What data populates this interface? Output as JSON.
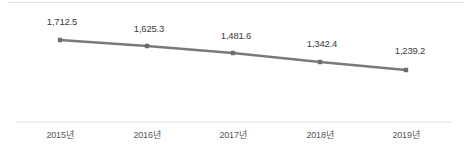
{
  "chart_data": {
    "type": "line",
    "title": "",
    "subtitle": "",
    "xlabel": "",
    "ylabel": "",
    "categories": [
      "2015년",
      "2016년",
      "2017년",
      "2018년",
      "2019년"
    ],
    "values": [
      1712.5,
      1625.3,
      1481.6,
      1342.4,
      1239.2
    ],
    "value_labels": [
      "1,712.5",
      "1,625.3",
      "1,481.6",
      "1,342.4",
      "1,239.2"
    ],
    "series": [
      {
        "name": "",
        "values": [
          1712.5,
          1625.3,
          1481.6,
          1342.4,
          1239.2
        ]
      }
    ],
    "ylim": [
      1100,
      1800
    ],
    "grid": false,
    "legend": "none",
    "annotations": [],
    "colors": {
      "line": "#7a7a7e",
      "marker": "#6e6e72",
      "value_text": "#3b3b3d",
      "category_text": "#55555a",
      "axis_line": "#e4e4e6",
      "top_rule": "#e2e2e4",
      "background": "#ffffff"
    },
    "points": [
      {
        "x": 60,
        "y": 40,
        "label_x": 62,
        "label_y": 16
      },
      {
        "x": 147,
        "y": 46,
        "label_x": 149,
        "label_y": 23
      },
      {
        "x": 233,
        "y": 53,
        "label_x": 236,
        "label_y": 30
      },
      {
        "x": 320,
        "y": 62,
        "label_x": 322,
        "label_y": 38
      },
      {
        "x": 406,
        "y": 70,
        "label_x": 410,
        "label_y": 45
      }
    ]
  }
}
